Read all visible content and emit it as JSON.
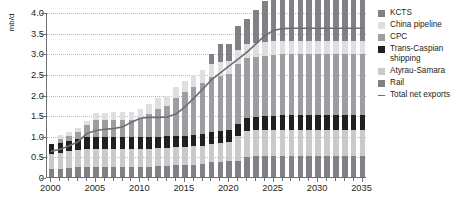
{
  "chart_data": {
    "type": "bar",
    "stacked": true,
    "title": "",
    "subtitle": "",
    "xlabel": "",
    "ylabel": "mb/d",
    "ylim": [
      0,
      4.0
    ],
    "yticks": [
      "0",
      "0.5",
      "1.0",
      "1.5",
      "2.0",
      "2.5",
      "3.0",
      "3.5",
      "4.0"
    ],
    "ytick_values": [
      0,
      0.5,
      1.0,
      1.5,
      2.0,
      2.5,
      3.0,
      3.5,
      4.0
    ],
    "xlim": [
      2000,
      2035
    ],
    "xticks": [
      "2000",
      "2005",
      "2010",
      "2015",
      "2020",
      "2025",
      "2030",
      "2035"
    ],
    "xtick_values": [
      2000,
      2005,
      2010,
      2015,
      2020,
      2025,
      2030,
      2035
    ],
    "grid": true,
    "grid_axis": "y",
    "legend_position": "right",
    "categories": [
      2000,
      2001,
      2002,
      2003,
      2004,
      2005,
      2006,
      2007,
      2008,
      2009,
      2010,
      2011,
      2012,
      2013,
      2014,
      2015,
      2016,
      2017,
      2018,
      2019,
      2020,
      2021,
      2022,
      2023,
      2024,
      2025,
      2026,
      2027,
      2028,
      2029,
      2030,
      2031,
      2032,
      2033,
      2034,
      2035
    ],
    "series": [
      {
        "name": "Rail",
        "color": "#7f8184",
        "values": [
          0.2,
          0.2,
          0.22,
          0.24,
          0.25,
          0.25,
          0.25,
          0.25,
          0.25,
          0.25,
          0.25,
          0.25,
          0.26,
          0.27,
          0.28,
          0.28,
          0.3,
          0.32,
          0.36,
          0.37,
          0.38,
          0.39,
          0.48,
          0.5,
          0.51,
          0.51,
          0.51,
          0.51,
          0.51,
          0.51,
          0.51,
          0.51,
          0.51,
          0.51,
          0.51,
          0.51
        ]
      },
      {
        "name": "Atyrau-Samara",
        "color": "#c9cacc",
        "values": [
          0.35,
          0.38,
          0.4,
          0.42,
          0.43,
          0.44,
          0.44,
          0.44,
          0.44,
          0.44,
          0.44,
          0.44,
          0.44,
          0.44,
          0.44,
          0.44,
          0.44,
          0.44,
          0.44,
          0.46,
          0.48,
          0.6,
          0.63,
          0.63,
          0.63,
          0.64,
          0.64,
          0.64,
          0.64,
          0.64,
          0.64,
          0.64,
          0.64,
          0.64,
          0.64,
          0.64
        ]
      },
      {
        "name": "Trans-Caspian shipping",
        "color": "#231f20",
        "values": [
          0.25,
          0.25,
          0.26,
          0.27,
          0.28,
          0.28,
          0.28,
          0.28,
          0.28,
          0.28,
          0.28,
          0.28,
          0.28,
          0.28,
          0.28,
          0.28,
          0.28,
          0.28,
          0.28,
          0.28,
          0.28,
          0.3,
          0.31,
          0.32,
          0.33,
          0.34,
          0.35,
          0.35,
          0.35,
          0.35,
          0.35,
          0.35,
          0.35,
          0.35,
          0.35,
          0.35
        ]
      },
      {
        "name": "CPC",
        "color": "#9c9ea1",
        "values": [
          0.0,
          0.1,
          0.12,
          0.16,
          0.3,
          0.4,
          0.41,
          0.42,
          0.42,
          0.42,
          0.45,
          0.55,
          0.68,
          0.72,
          0.92,
          1.05,
          1.16,
          1.25,
          1.35,
          1.35,
          1.35,
          1.45,
          1.47,
          1.47,
          1.47,
          1.47,
          1.47,
          1.47,
          1.47,
          1.47,
          1.47,
          1.47,
          1.47,
          1.47,
          1.47,
          1.47
        ]
      },
      {
        "name": "China pipeline",
        "color": "#dedfe0",
        "values": [
          0.0,
          0.1,
          0.1,
          0.1,
          0.1,
          0.18,
          0.18,
          0.18,
          0.18,
          0.18,
          0.22,
          0.24,
          0.25,
          0.25,
          0.25,
          0.27,
          0.29,
          0.3,
          0.3,
          0.32,
          0.33,
          0.33,
          0.33,
          0.33,
          0.33,
          0.33,
          0.33,
          0.33,
          0.33,
          0.33,
          0.33,
          0.33,
          0.33,
          0.33,
          0.33,
          0.33
        ]
      },
      {
        "name": "KCTS",
        "color": "#7f8184",
        "values": [
          0.0,
          0.0,
          0.0,
          0.0,
          0.0,
          0.0,
          0.0,
          0.0,
          0.0,
          0.0,
          0.0,
          0.0,
          0.0,
          0.0,
          0.0,
          0.0,
          0.0,
          0.0,
          0.25,
          0.45,
          0.4,
          0.6,
          0.6,
          0.8,
          1.0,
          1.1,
          1.08,
          1.08,
          1.08,
          1.08,
          1.08,
          1.08,
          1.08,
          1.08,
          1.08,
          1.08
        ]
      }
    ],
    "line_series": {
      "name": "Total net exports",
      "color": "#6d6e71",
      "values": [
        0.65,
        0.7,
        0.78,
        0.88,
        1.08,
        1.15,
        1.18,
        1.2,
        1.24,
        1.35,
        1.45,
        1.47,
        1.47,
        1.48,
        1.55,
        1.72,
        1.93,
        2.15,
        2.38,
        2.55,
        2.72,
        2.88,
        3.05,
        3.25,
        3.45,
        3.58,
        3.62,
        3.63,
        3.63,
        3.63,
        3.63,
        3.63,
        3.63,
        3.63,
        3.63,
        3.63
      ]
    }
  },
  "legend": {
    "items": [
      {
        "label": "KCTS",
        "color": "#7f8184",
        "type": "swatch"
      },
      {
        "label": "China pipeline",
        "color": "#dedfe0",
        "type": "swatch"
      },
      {
        "label": "CPC",
        "color": "#9c9ea1",
        "type": "swatch"
      },
      {
        "label": "Trans-Caspian shipping",
        "color": "#231f20",
        "type": "swatch"
      },
      {
        "label": "Atyrau-Samara",
        "color": "#c9cacc",
        "type": "swatch"
      },
      {
        "label": "Rail",
        "color": "#7f8184",
        "type": "swatch"
      },
      {
        "label": "Total net exports",
        "color": "#6d6e71",
        "type": "line"
      }
    ]
  },
  "colors": {
    "axis": "#6d6e71",
    "grid": "#b9babc",
    "text": "#231f20",
    "background": "#ffffff"
  }
}
